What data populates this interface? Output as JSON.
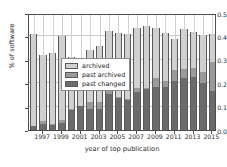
{
  "chart_data": {
    "type": "bar",
    "stacked": true,
    "title": "",
    "xlabel": "year of top publication",
    "ylabel": "% of software",
    "ylim": [
      0.0,
      0.5
    ],
    "ytick_values": [
      0.0,
      0.1,
      0.2,
      0.3,
      0.4,
      0.5
    ],
    "ytick_labels": [
      "0.0",
      "0.1",
      "0.2",
      "0.3",
      "0.4",
      "0.5"
    ],
    "grid": true,
    "legend_position": "center",
    "categories": [
      "1996",
      "1997",
      "1998",
      "1999",
      "2000",
      "2001",
      "2002",
      "2003",
      "2004",
      "2005",
      "2006",
      "2007",
      "2008",
      "2009",
      "2010",
      "2011",
      "2012",
      "2013",
      "2014",
      "2015"
    ],
    "xtick_labels": [
      "1997",
      "1999",
      "2001",
      "2003",
      "2005",
      "2007",
      "2009",
      "2011",
      "2013",
      "2015"
    ],
    "series": [
      {
        "name": "past changed",
        "color": "#6b6b6b",
        "values": [
          0.017,
          0.027,
          0.022,
          0.031,
          0.087,
          0.104,
          0.09,
          0.09,
          0.155,
          0.135,
          0.127,
          0.163,
          0.178,
          0.183,
          0.185,
          0.208,
          0.222,
          0.225,
          0.2,
          0.168
        ]
      },
      {
        "name": "past archived",
        "color": "#9a9a9a",
        "values": [
          0.0,
          0.01,
          0.003,
          0.01,
          0.003,
          0.0,
          0.03,
          0.03,
          0.017,
          0.005,
          0.005,
          0.015,
          0.003,
          0.039,
          0.025,
          0.05,
          0.038,
          0.042,
          0.047,
          0.122
        ]
      },
      {
        "name": "archived",
        "color": "#d0d0d0",
        "values": [
          0.393,
          0.283,
          0.305,
          0.359,
          0.222,
          0.198,
          0.22,
          0.24,
          0.251,
          0.275,
          0.28,
          0.257,
          0.264,
          0.215,
          0.205,
          0.132,
          0.172,
          0.152,
          0.157,
          0.12
        ]
      }
    ],
    "totals": [
      0.41,
      0.32,
      0.33,
      0.4,
      0.312,
      0.302,
      0.34,
      0.36,
      0.423,
      0.415,
      0.412,
      0.435,
      0.445,
      0.437,
      0.415,
      0.39,
      0.432,
      0.419,
      0.404,
      0.41
    ]
  },
  "legend": {
    "items": [
      {
        "label": "archived"
      },
      {
        "label": "past archived"
      },
      {
        "label": "past changed"
      }
    ]
  }
}
